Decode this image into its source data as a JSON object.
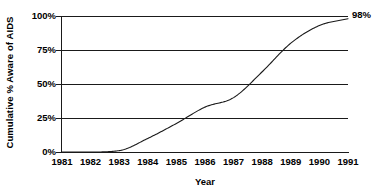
{
  "chart_data": {
    "type": "line",
    "title": "",
    "xlabel": "Year",
    "ylabel": "Cumulative % Aware of AIDS",
    "x": [
      1981,
      1982,
      1983,
      1984,
      1985,
      1986,
      1987,
      1988,
      1989,
      1990,
      1991
    ],
    "values": [
      0,
      0,
      1,
      10,
      21,
      33,
      40,
      59,
      80,
      93,
      98
    ],
    "series": [
      {
        "name": "Cumulative % Aware of AIDS",
        "values": [
          0,
          0,
          1,
          10,
          21,
          33,
          40,
          59,
          80,
          93,
          98
        ]
      }
    ],
    "xlim": [
      1981,
      1991
    ],
    "ylim": [
      0,
      100
    ],
    "ytick_labels": [
      "0%",
      "25%",
      "50%",
      "75%",
      "100%"
    ],
    "ytick_values": [
      0,
      25,
      50,
      75,
      100
    ],
    "xtick_labels": [
      "1981",
      "1982",
      "1983",
      "1984",
      "1985",
      "1986",
      "1987",
      "1988",
      "1989",
      "1990",
      "1991"
    ],
    "grid": "horizontal",
    "legend": "none",
    "line_color": "#1a1a1a",
    "annotations": [
      {
        "label": "98%",
        "x": 1991,
        "y": 98
      }
    ]
  },
  "axes": {
    "y_title": "Cumulative % Aware of AIDS",
    "x_title": "Year"
  },
  "end_label": "98%"
}
